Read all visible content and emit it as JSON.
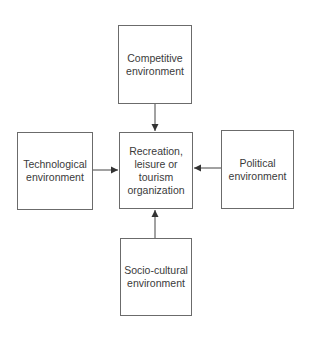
{
  "diagram": {
    "type": "influence-diagram",
    "center": {
      "label": "Recreation,\nleisure or\ntourism\norganization"
    },
    "nodes": {
      "top": {
        "label": "Competitive\nenvironment"
      },
      "left": {
        "label": "Technological\nenvironment"
      },
      "right": {
        "label": "Political\nenvironment"
      },
      "bottom": {
        "label": "Socio-cultural\nenvironment"
      }
    },
    "edges": [
      {
        "from": "Competitive environment",
        "to": "Recreation, leisure or tourism organization",
        "direction": "down"
      },
      {
        "from": "Technological environment",
        "to": "Recreation, leisure or tourism organization",
        "direction": "right"
      },
      {
        "from": "Political environment",
        "to": "Recreation, leisure or tourism organization",
        "direction": "left"
      },
      {
        "from": "Socio-cultural environment",
        "to": "Recreation, leisure or tourism organization",
        "direction": "up"
      }
    ],
    "colors": {
      "border": "#6b6b6b",
      "text": "#3a3a3a",
      "arrow": "#333333",
      "background": "#ffffff"
    }
  }
}
